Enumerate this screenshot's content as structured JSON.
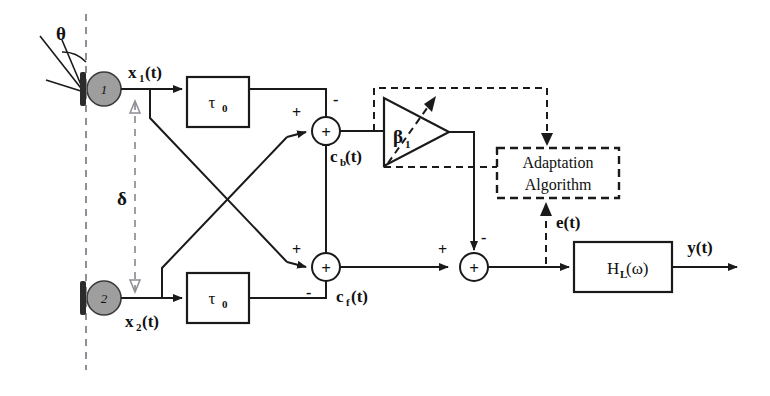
{
  "figure": {
    "type": "signal-flow-block-diagram"
  },
  "sensors": [
    {
      "id": "1",
      "number": "1",
      "signal_label": "x",
      "signal_sub": "1",
      "signal_suffix": "(t)"
    },
    {
      "id": "2",
      "number": "2",
      "signal_label": "x",
      "signal_sub": "2",
      "signal_suffix": "(t)"
    }
  ],
  "annotations": {
    "angle_symbol": "θ",
    "spacing_symbol": "δ"
  },
  "delay_blocks": [
    {
      "label": "τ",
      "sub": "0"
    },
    {
      "label": "τ",
      "sub": "0"
    }
  ],
  "summers": [
    {
      "name": "upper-summer",
      "symbol": "+",
      "input_signs": [
        "+",
        "-"
      ],
      "output_label": "c",
      "output_sub": "b",
      "output_suffix": "(t)"
    },
    {
      "name": "lower-summer",
      "symbol": "+",
      "input_signs": [
        "+",
        "-"
      ],
      "output_label": "c",
      "output_sub": "f",
      "output_suffix": "(t)"
    },
    {
      "name": "output-summer",
      "symbol": "+",
      "input_signs": [
        "+",
        "-"
      ],
      "output_label": "",
      "output_sub": "",
      "output_suffix": ""
    }
  ],
  "amplifier": {
    "name": "variable-gain-amplifier",
    "gain_symbol": "β",
    "gain_sub": "1",
    "variable": true
  },
  "adaptation_block": {
    "line1": "Adaptation",
    "line2": "Algorithm",
    "style": "dashed"
  },
  "error_signal": {
    "label": "e(t)"
  },
  "output_filter": {
    "label": "H",
    "sub": "L",
    "suffix": "(ω)"
  },
  "output_signal": {
    "label": "y(t)"
  },
  "colors": {
    "line": "#1a1a1a",
    "sensor_fill": "#9e9e9e",
    "sensor_bar": "#2b2b2b",
    "axis_dash": "#7d7d86",
    "background": "#ffffff"
  }
}
